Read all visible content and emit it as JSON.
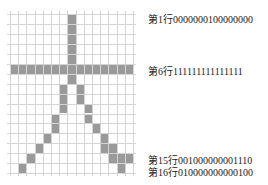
{
  "grid": {
    "rows": 16,
    "cols": 15,
    "fill_color": "#9a9a9a",
    "line_color": "#d4d4d4",
    "filled_cells": [
      [
        1,
        8
      ],
      [
        2,
        8
      ],
      [
        3,
        8
      ],
      [
        4,
        8
      ],
      [
        5,
        8
      ],
      [
        6,
        1
      ],
      [
        6,
        2
      ],
      [
        6,
        3
      ],
      [
        6,
        4
      ],
      [
        6,
        5
      ],
      [
        6,
        6
      ],
      [
        6,
        7
      ],
      [
        6,
        8
      ],
      [
        6,
        9
      ],
      [
        6,
        10
      ],
      [
        6,
        11
      ],
      [
        6,
        12
      ],
      [
        6,
        13
      ],
      [
        6,
        14
      ],
      [
        6,
        15
      ],
      [
        7,
        8
      ],
      [
        8,
        7
      ],
      [
        8,
        9
      ],
      [
        9,
        7
      ],
      [
        9,
        9
      ],
      [
        10,
        7
      ],
      [
        10,
        10
      ],
      [
        11,
        6
      ],
      [
        11,
        10
      ],
      [
        12,
        6
      ],
      [
        12,
        11
      ],
      [
        13,
        5
      ],
      [
        13,
        12
      ],
      [
        14,
        4
      ],
      [
        14,
        12
      ],
      [
        14,
        13
      ],
      [
        15,
        3
      ],
      [
        15,
        13
      ],
      [
        15,
        14
      ],
      [
        15,
        15
      ],
      [
        16,
        2
      ],
      [
        16,
        14
      ]
    ]
  },
  "labels": [
    {
      "row": 1,
      "text": "第1行0000000100000000"
    },
    {
      "row": 6,
      "text": "第6行111111111111111"
    },
    {
      "row": 15,
      "text": "第15行001000000001110"
    },
    {
      "row": 16,
      "text": "第16行010000000000100"
    }
  ]
}
